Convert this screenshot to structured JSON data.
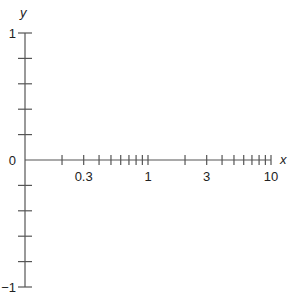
{
  "chart_data": {
    "type": "line",
    "title": "",
    "xlabel": "x",
    "ylabel": "y",
    "x_scale": "log",
    "xlim": [
      0.1,
      10
    ],
    "ylim": [
      -1,
      1
    ],
    "x_tick_labels": [
      "0.3",
      "1",
      "3",
      "10"
    ],
    "x_tick_label_values": [
      0.3,
      1,
      3,
      10
    ],
    "x_minor_ticks": [
      0.2,
      0.3,
      0.4,
      0.5,
      0.6,
      0.7,
      0.8,
      0.9,
      1,
      2,
      3,
      4,
      5,
      6,
      7,
      8,
      9,
      10
    ],
    "y_tick_labels": [
      "1",
      "0",
      "−1"
    ],
    "y_tick_label_values": [
      1,
      0,
      -1
    ],
    "y_ticks": [
      1,
      0.8,
      0.6,
      0.4,
      0.2,
      -0.2,
      -0.4,
      -0.6,
      -0.8,
      -1
    ],
    "grid": false,
    "legend": null,
    "series": []
  },
  "colors": {
    "axis": "#555555",
    "text": "#222222",
    "background": "#ffffff"
  }
}
